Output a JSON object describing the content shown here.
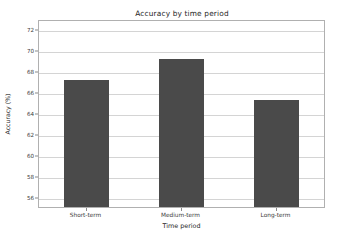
{
  "chart_data": {
    "type": "bar",
    "title": "Accuracy by time period",
    "xlabel": "Time period",
    "ylabel": "Accuracy (%)",
    "categories": [
      "Short-term",
      "Medium-term",
      "Long-term"
    ],
    "values": [
      67.4,
      69.4,
      65.4
    ],
    "series": [
      {
        "name": "Accuracy",
        "values": [
          67.4,
          69.4,
          65.4
        ]
      }
    ],
    "yticks": [
      56,
      58,
      60,
      62,
      64,
      66,
      68,
      70,
      72
    ],
    "ytick_labels": [
      "56",
      "58",
      "60",
      "62",
      "64",
      "66",
      "68",
      "70",
      "72"
    ],
    "ylim": [
      55.2,
      73.0
    ],
    "grid": true,
    "grid_axis": "y",
    "legend": null,
    "legend_position": "none",
    "bar_color": "#4a4a4a",
    "grid_color": "#d4d4d4",
    "frame_color": "#b0b0b0",
    "background_color": "#ffffff",
    "bar_width_ratio": 0.47
  }
}
